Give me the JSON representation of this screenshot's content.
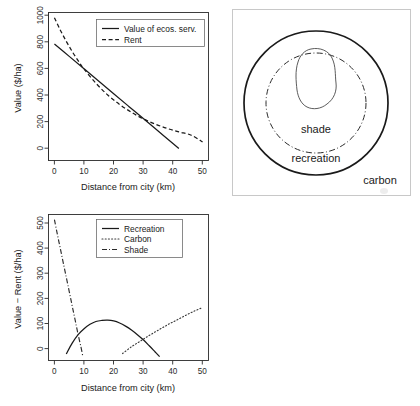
{
  "figure": {
    "background_color": "#ffffff",
    "line_color": "#1a1a1a",
    "frame_color": "#c8c8c8"
  },
  "panels": {
    "top_left": {
      "name": "value-vs-distance-chart"
    },
    "top_right": {
      "name": "concentric-zones-diagram",
      "labels": {
        "inner": "shade",
        "middle": "recreation",
        "outer": "carbon"
      }
    },
    "bottom_left": {
      "name": "value-minus-rent-chart"
    }
  },
  "chart_data": [
    {
      "id": "top-left",
      "type": "line",
      "title": "",
      "xlabel": "Distance from city (km)",
      "ylabel": "Value ($/ha)",
      "xlim": [
        -2,
        52
      ],
      "ylim": [
        -90,
        1040
      ],
      "xticks": [
        0,
        10,
        20,
        30,
        40,
        50
      ],
      "yticks": [
        0,
        200,
        400,
        600,
        800,
        1000
      ],
      "grid": false,
      "legend_position": "top-right",
      "series": [
        {
          "name": "Value of ecos. serv.",
          "style": "solid",
          "x": [
            0,
            5,
            10,
            15,
            20,
            25,
            30,
            35,
            40,
            42
          ],
          "y": [
            800,
            705,
            610,
            515,
            420,
            325,
            230,
            135,
            40,
            2
          ]
        },
        {
          "name": "Rent",
          "style": "dashed",
          "x": [
            0,
            2,
            4,
            6,
            8,
            10,
            14,
            18,
            22,
            26,
            30,
            34,
            38,
            42,
            46,
            50
          ],
          "y": [
            1000,
            905,
            820,
            742,
            672,
            608,
            500,
            410,
            338,
            278,
            228,
            188,
            155,
            128,
            105,
            52
          ]
        }
      ]
    },
    {
      "id": "bottom-left",
      "type": "line",
      "title": "",
      "xlabel": "Distance from city (km)",
      "ylabel": "Value − Rent ($/ha)",
      "xlim": [
        -2,
        52
      ],
      "ylim": [
        -45,
        520
      ],
      "xticks": [
        0,
        10,
        20,
        30,
        40,
        50
      ],
      "yticks": [
        0,
        100,
        200,
        300,
        400,
        500
      ],
      "grid": false,
      "legend_position": "top-right",
      "series": [
        {
          "name": "Recreation",
          "style": "solid",
          "x": [
            4,
            6,
            8,
            10,
            12,
            14,
            16,
            18,
            20,
            22,
            24,
            26,
            28,
            30,
            32,
            34,
            35.5
          ],
          "y": [
            -20,
            22,
            55,
            78,
            95,
            106,
            110,
            111,
            108,
            100,
            88,
            73,
            55,
            35,
            12,
            -12,
            -30
          ]
        },
        {
          "name": "Carbon",
          "style": "dotted",
          "x": [
            23,
            26,
            29,
            32,
            35,
            38,
            41,
            44,
            47,
            50
          ],
          "y": [
            -18,
            8,
            30,
            52,
            72,
            92,
            110,
            128,
            145,
            160
          ]
        },
        {
          "name": "Shade",
          "style": "dash-dot",
          "x": [
            0,
            1,
            2,
            3,
            4,
            5,
            6,
            7,
            8,
            9,
            9.6
          ],
          "y": [
            500,
            443,
            388,
            332,
            277,
            222,
            166,
            111,
            55,
            5,
            -30
          ]
        }
      ]
    }
  ]
}
